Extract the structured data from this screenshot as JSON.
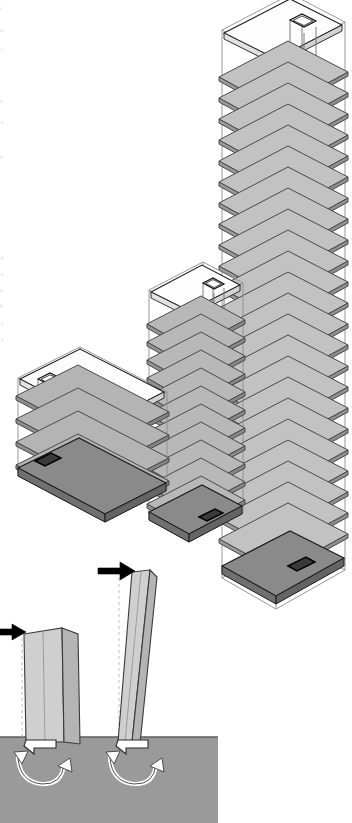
{
  "figure": {
    "type": "architectural-structural-axonometric-diagram",
    "background_color": "#ffffff",
    "width": 352,
    "height": 823
  },
  "margin_text": {
    "note": "partial characters cropped at the left page edge",
    "fragments": [
      "c",
      "o",
      "t",
      "a",
      "e",
      "g",
      "d",
      "n",
      "e",
      "a",
      "h",
      "t"
    ]
  },
  "palette": {
    "outline": "#2b2b2b",
    "slab_light": "#c2c2c2",
    "slab_mid": "#b0b0b0",
    "slab_dark": "#8f8f8f",
    "slab_edge": "#4a4a4a",
    "roof_white": "#fdfdfd",
    "wireframe": "#8d8d8d",
    "ground": "#9a9a9a",
    "column_face": "#cfcfcf",
    "column_side": "#b4b4b4",
    "arrow_black": "#000000",
    "arrow_white": "#ffffff"
  },
  "massing": {
    "label": "stepped massing axonometric",
    "projection": "isometric",
    "blocks": [
      {
        "name": "low-block",
        "storeys": 5,
        "position": "left",
        "has_roof_slab": true,
        "has_core_shaft": true,
        "core_shaft_label": "vertical circulation core",
        "envelope": "transparent wireframe"
      },
      {
        "name": "mid-tower",
        "storeys": 13,
        "position": "center",
        "has_roof_slab": true,
        "has_core_shaft": true,
        "core_shaft_label": "vertical circulation core",
        "envelope": "transparent wireframe"
      },
      {
        "name": "high-tower",
        "storeys": 26,
        "position": "right",
        "has_roof_slab": true,
        "has_core_shaft": true,
        "core_shaft_label": "vertical circulation core",
        "envelope": "transparent wireframe"
      }
    ]
  },
  "deflection_diagram": {
    "label": "lateral load cantilever deflection comparison",
    "ground_label": "ground / foundation mass",
    "cases": [
      {
        "name": "short-cantilever",
        "height_class": "low",
        "load_arrow": "lateral point load at top",
        "load_arrow_direction": "right",
        "reference_line": "undeflected axis (dashed)",
        "base_reaction": "overturning moment couple",
        "rotation_arrow": "double-headed curved arrow"
      },
      {
        "name": "tall-cantilever",
        "height_class": "high",
        "load_arrow": "lateral point load at top",
        "load_arrow_direction": "right",
        "reference_line": "undeflected axis (dashed)",
        "base_reaction": "overturning moment couple",
        "rotation_arrow": "double-headed curved arrow"
      }
    ]
  }
}
